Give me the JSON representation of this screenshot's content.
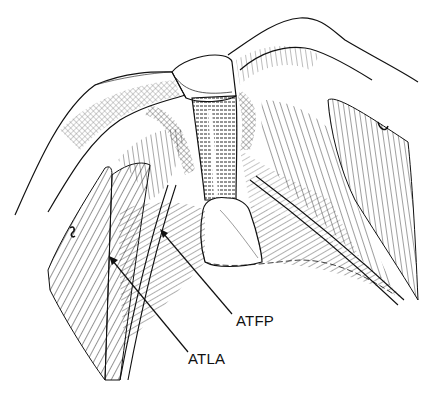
{
  "figure": {
    "type": "anatomical line drawing",
    "colors": {
      "ink": "#111111",
      "background": "#ffffff"
    }
  },
  "labels": [
    {
      "id": "atfp",
      "text": "ATFP"
    },
    {
      "id": "atla",
      "text": "ATLA"
    }
  ]
}
